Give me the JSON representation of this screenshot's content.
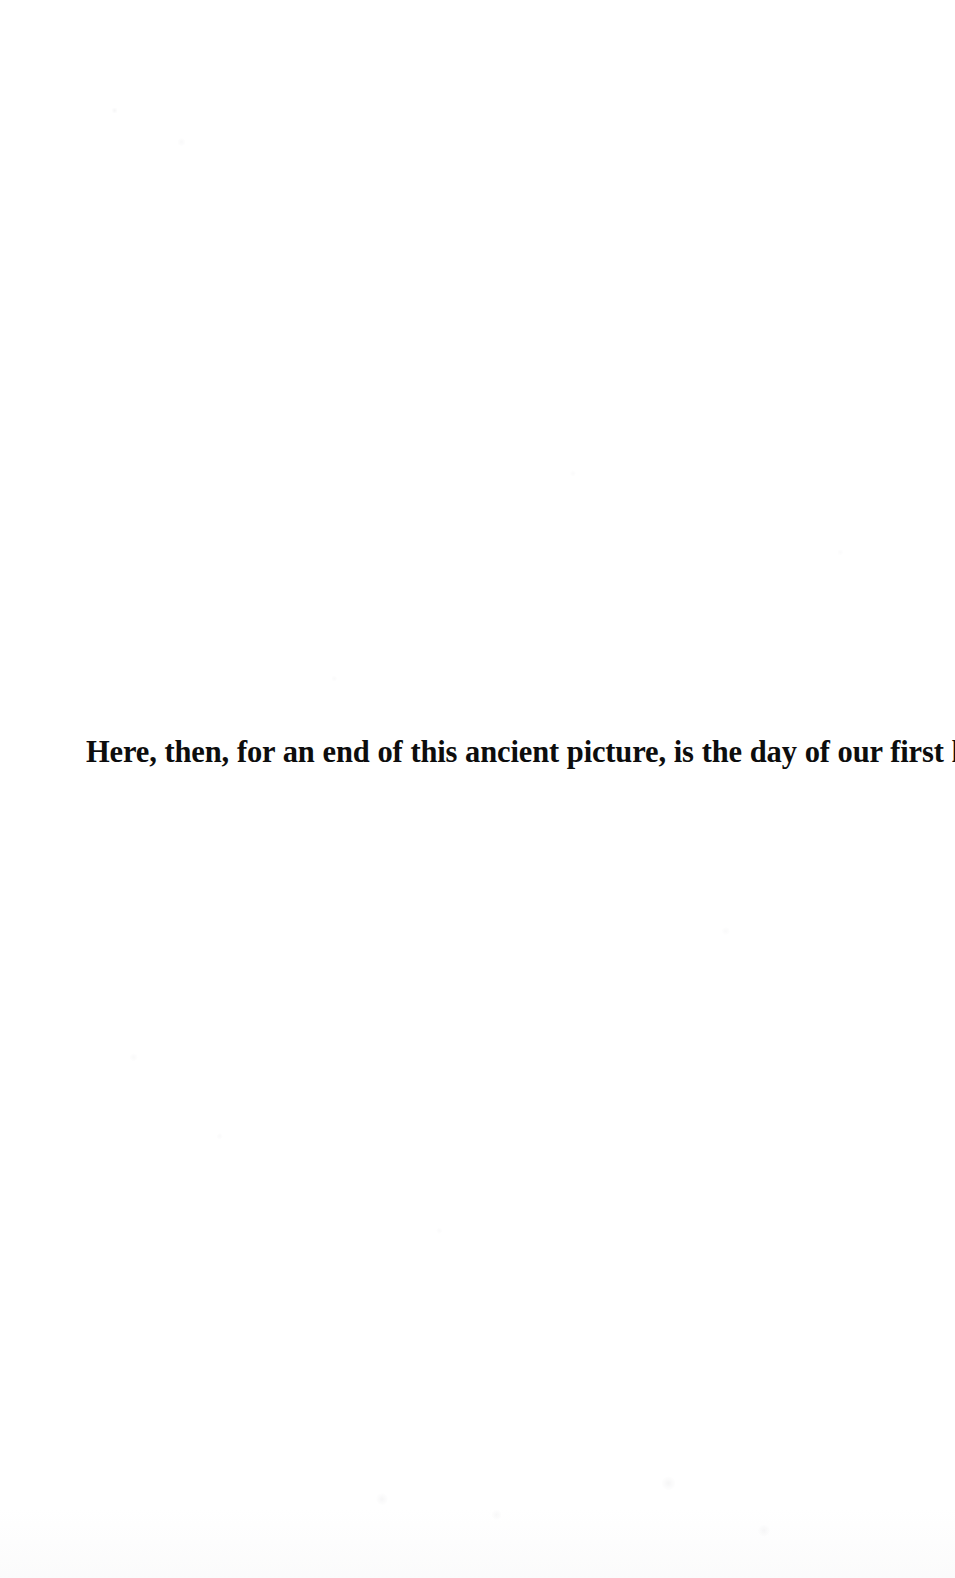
{
  "document": {
    "type": "scanned-book-page",
    "page_background_color": "#ffffff",
    "text_color": "#0d0d0d",
    "body": {
      "lines": [
        {
          "text": "Here, then, for an end of this ancient picture, is the day of our first kill.",
          "style": "bold-serif"
        }
      ]
    }
  }
}
